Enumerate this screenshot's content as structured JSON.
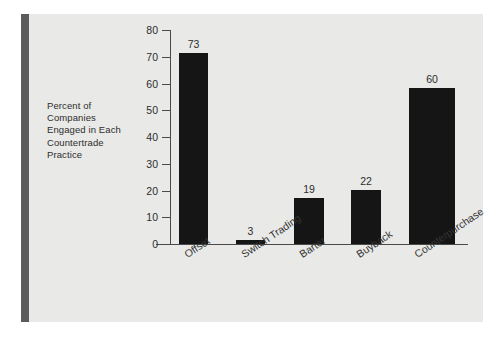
{
  "figure": {
    "panel_color": "#e9e9e7",
    "page_color": "#ffffff",
    "rule_color": "#5b5b5b",
    "bar_color": "#151515",
    "axis_color": "#4a4a4a",
    "text_color": "#2d2d2d"
  },
  "axis_title_lines": [
    "Percent of",
    "Companies",
    "Engaged in Each",
    "Countertrade",
    "Practice"
  ],
  "chart_data": {
    "type": "bar",
    "title": "",
    "subtitle": "",
    "xlabel": "",
    "ylabel": "Percent of Companies Engaged in Each Countertrade Practice",
    "categories": [
      "Offset",
      "Switch Trading",
      "Barter",
      "Buyback",
      "Counterpurchase"
    ],
    "values": [
      73,
      3,
      19,
      22,
      60
    ],
    "value_labels": [
      "73",
      "3",
      "19",
      "22",
      "60"
    ],
    "ylim": [
      0,
      80
    ],
    "ytick_labels": [
      "0",
      "10",
      "20",
      "30",
      "40",
      "50",
      "60",
      "70",
      "80"
    ],
    "yticks": [
      0,
      10,
      20,
      30,
      40,
      50,
      60,
      70,
      80
    ],
    "grid": false,
    "legend": false,
    "legend_position": "none",
    "orientation": "vertical",
    "xtick_rotation": -34
  }
}
